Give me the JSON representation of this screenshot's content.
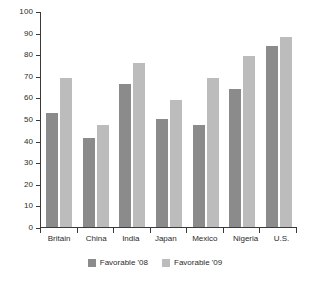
{
  "chart_data": {
    "type": "bar",
    "title": "",
    "subtitle": "",
    "xlabel": "",
    "ylabel": "",
    "ylim": [
      0,
      100
    ],
    "ytick_step": 10,
    "yticks": [
      100,
      90,
      80,
      70,
      60,
      50,
      40,
      30,
      20,
      10,
      0
    ],
    "grid": false,
    "legend_position": "bottom-center",
    "categories": [
      "Britain",
      "China",
      "India",
      "Japan",
      "Mexico",
      "Nigeria",
      "U.S."
    ],
    "series": [
      {
        "name": "Favorable '08",
        "color": "#8b8b8b",
        "values": [
          53,
          41,
          66,
          50,
          47,
          64,
          84
        ]
      },
      {
        "name": "Favorable '09",
        "color": "#bcbcbc",
        "values": [
          69,
          47,
          76,
          59,
          69,
          79,
          88
        ]
      }
    ]
  },
  "legend": {
    "items": [
      {
        "label": "Favorable '08",
        "color": "#8b8b8b"
      },
      {
        "label": "Favorable '09",
        "color": "#bcbcbc"
      }
    ]
  },
  "colors": {
    "series_08": "#8b8b8b",
    "series_09": "#bcbcbc",
    "axis": "#3a3a3a",
    "text": "#2b2b2b",
    "background": "#ffffff"
  }
}
